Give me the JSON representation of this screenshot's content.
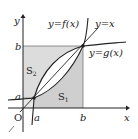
{
  "figure": {
    "axis_labels": {
      "x": "x",
      "y": "y",
      "origin": "O"
    },
    "tick_labels": {
      "a_x": "a",
      "b_x": "b",
      "a_y": "a",
      "b_y": "b"
    },
    "curve_labels": {
      "f": "y=f(x)",
      "line": "y=x",
      "g": "y=g(x)"
    },
    "region_labels": {
      "s1": "S",
      "s1_sub": "1",
      "s2": "S",
      "s2_sub": "2"
    },
    "colors": {
      "shade_light": "#e6e6e6",
      "shade_dark": "#cfcfcf",
      "stroke": "#222222"
    }
  }
}
